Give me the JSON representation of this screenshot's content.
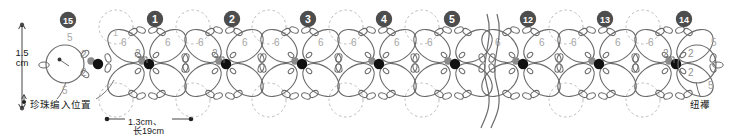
{
  "document": {
    "title": "Tatting motif chain pattern diagram",
    "type": "craft-pattern-schematic"
  },
  "labels": {
    "height_measure": "1.5\ncm",
    "height_measure_line1": "1.5",
    "height_measure_line2": "cm",
    "pearl_position": "珍珠编入位置",
    "width_measure": "●—1.3cm、—●",
    "width_measure_text": "1.3cm、",
    "total_length": "长19cm",
    "button_loop": "纽襻"
  },
  "step_markers": [
    {
      "label": "15",
      "glyph": "⑮",
      "x": 68,
      "y": 20
    },
    {
      "label": "1",
      "glyph": "❶",
      "x": 155,
      "y": 19
    },
    {
      "label": "2",
      "glyph": "❷",
      "x": 232,
      "y": 19
    },
    {
      "label": "3",
      "glyph": "❸",
      "x": 308,
      "y": 19
    },
    {
      "label": "4",
      "glyph": "❹",
      "x": 384,
      "y": 19
    },
    {
      "label": "5",
      "glyph": "❺",
      "x": 452,
      "y": 19
    },
    {
      "label": "12",
      "glyph": "⑫",
      "x": 528,
      "y": 19
    },
    {
      "label": "13",
      "glyph": "⑬",
      "x": 605,
      "y": 19
    },
    {
      "label": "14",
      "glyph": "⑭",
      "x": 684,
      "y": 19
    }
  ],
  "motifs": {
    "count": 7,
    "start_x": 147,
    "spacing": 76.5,
    "center_y": 63,
    "petal_stitch_count": "6",
    "join_stitch_count": "2",
    "end_ring_stitch_count": "5"
  },
  "stitch_numbers": {
    "petal": "6",
    "picot_join": "2",
    "end_ring": "5",
    "inner": "1"
  },
  "colors": {
    "line": "#6b6b6b",
    "dark_line": "#4a4a4a",
    "dot": "#111111",
    "grey_dot": "#8a8a8a",
    "dashed": "#b9b9b9",
    "number_grey": "#a6a6a6",
    "marker_fill": "#4d4d4d",
    "text": "#1a1a1a",
    "background": "#ffffff"
  },
  "measurements": {
    "height_cm": 1.5,
    "motif_width_cm": 1.3,
    "total_length_cm": 19
  }
}
